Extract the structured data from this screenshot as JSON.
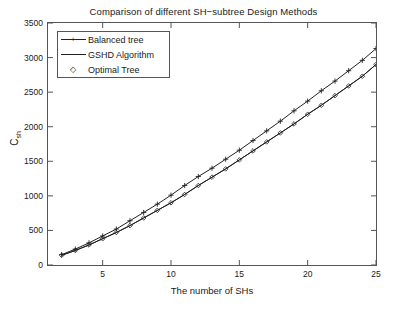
{
  "chart_data": {
    "type": "line",
    "title": "Comparison of different SH−subtree Design Methods",
    "xlabel": "The number of SHs",
    "ylabel": "C_sh",
    "ylabel_main": "C",
    "ylabel_sub": "sh",
    "xlim": [
      1,
      25
    ],
    "ylim": [
      0,
      3500
    ],
    "xticks": [
      5,
      10,
      15,
      20,
      25
    ],
    "yticks": [
      0,
      500,
      1000,
      1500,
      2000,
      2500,
      3000,
      3500
    ],
    "xtick_labels": [
      "5",
      "10",
      "15",
      "20",
      "25"
    ],
    "ytick_labels": [
      "0",
      "500",
      "1000",
      "1500",
      "2000",
      "2500",
      "3000",
      "3500"
    ],
    "grid": false,
    "legend_position": "upper left",
    "x": [
      2,
      3,
      4,
      5,
      6,
      7,
      8,
      9,
      10,
      11,
      12,
      13,
      14,
      15,
      16,
      17,
      18,
      19,
      20,
      21,
      22,
      23,
      24,
      25
    ],
    "series": [
      {
        "name": "Balanced tree",
        "marker": "+",
        "color": "#222222",
        "values": [
          150,
          230,
          320,
          420,
          520,
          640,
          760,
          880,
          1010,
          1150,
          1280,
          1400,
          1530,
          1660,
          1800,
          1940,
          2080,
          2230,
          2370,
          2520,
          2660,
          2810,
          2960,
          3130
        ]
      },
      {
        "name": "GSHD Algorithm",
        "marker": "none",
        "color": "#222222",
        "values": [
          140,
          210,
          290,
          380,
          470,
          570,
          680,
          790,
          900,
          1020,
          1150,
          1270,
          1390,
          1520,
          1650,
          1780,
          1910,
          2040,
          2180,
          2310,
          2450,
          2590,
          2730,
          2900
        ]
      },
      {
        "name": "Optimal Tree",
        "marker": "diamond",
        "color": "#222222",
        "values": [
          140,
          210,
          290,
          380,
          470,
          570,
          680,
          790,
          900,
          1020,
          1150,
          1270,
          1390,
          1520,
          1650,
          1780,
          1910,
          2040,
          2180,
          2310,
          2450,
          2590,
          2730,
          2900
        ]
      }
    ],
    "legend": [
      {
        "label": "Balanced tree",
        "marker": "+"
      },
      {
        "label": "GSHD Algorithm",
        "marker": "none"
      },
      {
        "label": "Optimal Tree",
        "marker": "diamond"
      }
    ]
  }
}
